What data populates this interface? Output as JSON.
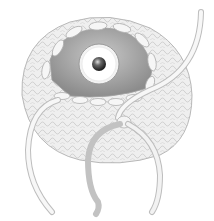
{
  "illustration": {
    "subject": "crocheted cup with eye-like ball inside and drawstrings",
    "colors": {
      "background": "#ffffff",
      "crochet_fill": "#eeeeee",
      "crochet_stroke": "#bdbdbd",
      "inner_cavity": "#9a9a9a",
      "eye_white": "#f4f4f4",
      "pupil": "#3a3a3a",
      "string_light": "#f2f2f2",
      "string_dark": "#c4c4c4"
    }
  }
}
